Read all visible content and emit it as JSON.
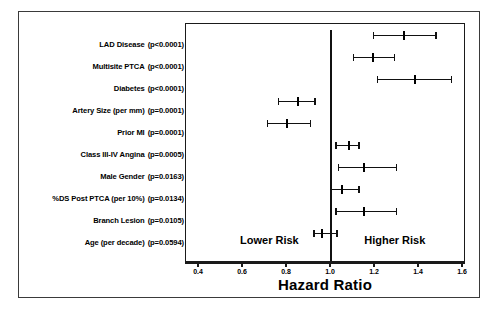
{
  "chart_data": {
    "type": "scatter",
    "subtype": "forest-plot",
    "title": "",
    "xlabel": "Hazard Ratio",
    "ylabel": "",
    "xlim": [
      0.35,
      1.65
    ],
    "xticks": [
      "0.4",
      "0.6",
      "0.8",
      "1.0",
      "1.2",
      "1.4",
      "1.6"
    ],
    "xtick_values": [
      0.4,
      0.6,
      0.8,
      1.0,
      1.2,
      1.4,
      1.6
    ],
    "grid": false,
    "legend": "none",
    "reference_line": 1.0,
    "annotations": [
      {
        "name": "lower-risk",
        "text": "Lower Risk",
        "x": 0.72
      },
      {
        "name": "higher-risk",
        "text": "Higher Risk",
        "x": 1.29
      }
    ],
    "categories": [
      "LAD Disease",
      "Multisite PTCA",
      "Diabetes",
      "Artery Size (per mm)",
      "Prior MI",
      "Class III-IV Angina",
      "Male Gender",
      "%DS Post PTCA (per 10%)",
      "Branch Lesion",
      "Age (per decade)"
    ],
    "pvalues": [
      "(p<0.0001)",
      "(p<0.0001)",
      "(p<0.0001)",
      "(p=0.0001)",
      "(p=0.0001)",
      "(p=0.0005)",
      "(p=0.0163)",
      "(p=0.0134)",
      "(p=0.0105)",
      "(p=0.0594)"
    ],
    "rows": [
      {
        "label": "LAD Disease",
        "pvalue": "(p<0.0001)",
        "hr": 1.33,
        "ci_low": 1.19,
        "ci_high": 1.48
      },
      {
        "label": "Multisite PTCA",
        "pvalue": "(p<0.0001)",
        "hr": 1.19,
        "ci_low": 1.1,
        "ci_high": 1.29
      },
      {
        "label": "Diabetes",
        "pvalue": "(p<0.0001)",
        "hr": 1.38,
        "ci_low": 1.21,
        "ci_high": 1.55
      },
      {
        "label": "Artery Size (per mm)",
        "pvalue": "(p=0.0001)",
        "hr": 0.85,
        "ci_low": 0.76,
        "ci_high": 0.93
      },
      {
        "label": "Prior MI",
        "pvalue": "(p=0.0001)",
        "hr": 0.8,
        "ci_low": 0.71,
        "ci_high": 0.91
      },
      {
        "label": "Class III-IV Angina",
        "pvalue": "(p=0.0005)",
        "hr": 1.08,
        "ci_low": 1.02,
        "ci_high": 1.13
      },
      {
        "label": "Male Gender",
        "pvalue": "(p=0.0163)",
        "hr": 1.15,
        "ci_low": 1.03,
        "ci_high": 1.3
      },
      {
        "label": "%DS Post PTCA (per 10%)",
        "pvalue": "(p=0.0134)",
        "hr": 1.05,
        "ci_low": 1.0,
        "ci_high": 1.13
      },
      {
        "label": "Branch Lesion",
        "pvalue": "(p=0.0105)",
        "hr": 1.15,
        "ci_low": 1.02,
        "ci_high": 1.3
      },
      {
        "label": "Age (per decade)",
        "pvalue": "(p=0.0594)",
        "hr": 0.96,
        "ci_low": 0.92,
        "ci_high": 1.03
      }
    ]
  }
}
